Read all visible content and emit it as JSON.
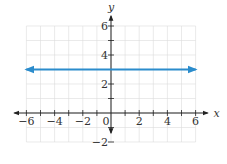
{
  "chart_data": {
    "type": "line",
    "title": "",
    "xlabel": "x",
    "ylabel": "y",
    "xlim": [
      -6,
      6
    ],
    "ylim": [
      -2,
      6
    ],
    "grid": true,
    "x_ticks": [
      -6,
      -4,
      -2,
      0,
      2,
      4,
      6
    ],
    "y_ticks": [
      -2,
      2,
      4,
      6
    ],
    "x_tick_labels": [
      "−6",
      "−4",
      "−2",
      "0",
      "2",
      "4",
      "6"
    ],
    "y_tick_labels": [
      "−2",
      "2",
      "4",
      "6"
    ],
    "series": [
      {
        "name": "y = 3",
        "x": [
          -6,
          6
        ],
        "y": [
          3,
          3
        ],
        "color": "#2b8ccc",
        "arrows_both_ends": true
      }
    ]
  },
  "colors": {
    "line": "#2b8ccc",
    "axis": "#222222",
    "grid": "#dcdcdc"
  }
}
